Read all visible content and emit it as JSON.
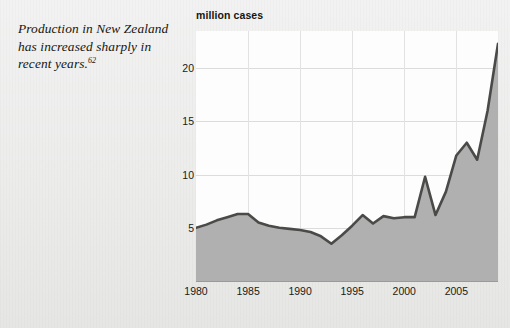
{
  "caption": {
    "text": "Production in New Zealand has increased sharply in recent years.",
    "footnote": "62"
  },
  "colors": {
    "page_background": "#ececeb",
    "plot_background": "#fdfdfd",
    "line": "#4a4a48",
    "area_fill": "#b0b0b0",
    "gridline": "#dcdcdc",
    "text": "#17160f"
  },
  "chart_data": {
    "type": "area",
    "title": "",
    "ylabel": "million cases",
    "xlabel": "",
    "xlim": [
      1980,
      2009
    ],
    "ylim": [
      0,
      23.5
    ],
    "yticks": [
      5,
      10,
      15,
      20
    ],
    "xticks": [
      1980,
      1985,
      1990,
      1995,
      2000,
      2005
    ],
    "grid": true,
    "legend": "none",
    "x": [
      1980,
      1981,
      1982,
      1983,
      1984,
      1985,
      1986,
      1987,
      1988,
      1989,
      1990,
      1991,
      1992,
      1993,
      1994,
      1995,
      1996,
      1997,
      1998,
      1999,
      2000,
      2001,
      2002,
      2003,
      2004,
      2005,
      2006,
      2007,
      2008,
      2009
    ],
    "values": [
      5.0,
      5.3,
      5.7,
      6.0,
      6.3,
      6.3,
      5.5,
      5.2,
      5.0,
      4.9,
      4.8,
      4.6,
      4.2,
      3.5,
      4.3,
      5.2,
      6.2,
      5.4,
      6.1,
      5.9,
      6.0,
      6.0,
      9.8,
      6.2,
      8.4,
      11.8,
      13.0,
      11.4,
      16.0,
      22.3
    ],
    "unit": "million cases"
  }
}
